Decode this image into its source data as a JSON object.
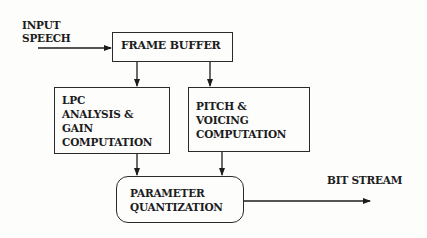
{
  "diagram": {
    "input_label_line1": "INPUT",
    "input_label_line2": "SPEECH",
    "output_label": "BIT STREAM",
    "blocks": {
      "frame_buffer": {
        "label": "FRAME BUFFER"
      },
      "lpc": {
        "line1": "LPC",
        "line2": "ANALYSIS &",
        "line3": "GAIN",
        "line4": "COMPUTATION"
      },
      "pitch": {
        "line1": "PITCH &",
        "line2": "VOICING",
        "line3": "COMPUTATION"
      },
      "quantization": {
        "line1": "PARAMETER",
        "line2": "QUANTIZATION"
      }
    },
    "edges": [
      {
        "from": "input",
        "to": "frame_buffer"
      },
      {
        "from": "frame_buffer",
        "to": "lpc"
      },
      {
        "from": "frame_buffer",
        "to": "pitch"
      },
      {
        "from": "lpc",
        "to": "quantization"
      },
      {
        "from": "pitch",
        "to": "quantization"
      },
      {
        "from": "quantization",
        "to": "output"
      }
    ],
    "colors": {
      "ink": "#1c1c1c",
      "background": "#fdfdfc"
    }
  }
}
